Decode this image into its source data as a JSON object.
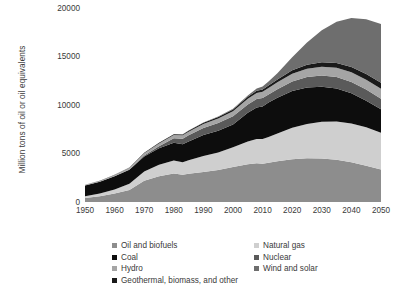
{
  "chart_data": {
    "type": "area",
    "stacked": true,
    "title": "",
    "subtitle": "",
    "xlabel": "",
    "ylabel": "Million tons of oil or oil equivalents",
    "xlim": [
      1950,
      2050
    ],
    "ylim": [
      0,
      20000
    ],
    "grid": false,
    "legend_position": "bottom",
    "x_ticks": [
      "1950",
      "1960",
      "1970",
      "1980",
      "1990",
      "2000",
      "2010",
      "2020",
      "2030",
      "2040",
      "2050"
    ],
    "y_ticks": [
      "0",
      "5000",
      "10000",
      "15000",
      "20000"
    ],
    "x": [
      1950,
      1955,
      1960,
      1965,
      1970,
      1975,
      1980,
      1983,
      1985,
      1990,
      1995,
      2000,
      2005,
      2008,
      2010,
      2012,
      2015,
      2020,
      2025,
      2030,
      2035,
      2040,
      2045,
      2050
    ],
    "series": [
      {
        "name": "Oil and biofuels",
        "color": "#8d8d8d",
        "values": [
          420,
          600,
          880,
          1250,
          2200,
          2650,
          2950,
          2800,
          2900,
          3100,
          3300,
          3600,
          3900,
          4000,
          3950,
          4050,
          4200,
          4400,
          4500,
          4480,
          4350,
          4100,
          3750,
          3350
        ]
      },
      {
        "name": "Natural gas",
        "color": "#cfcfcf",
        "values": [
          180,
          280,
          420,
          620,
          950,
          1180,
          1320,
          1300,
          1400,
          1650,
          1800,
          2050,
          2350,
          2500,
          2550,
          2650,
          2850,
          3250,
          3550,
          3800,
          3950,
          4000,
          3950,
          3800
        ]
      },
      {
        "name": "Coal",
        "color": "#0d0d0d",
        "values": [
          1100,
          1200,
          1350,
          1450,
          1550,
          1700,
          1850,
          1850,
          1950,
          2150,
          2250,
          2350,
          2950,
          3250,
          3350,
          3550,
          3700,
          3800,
          3750,
          3600,
          3400,
          3100,
          2750,
          2400
        ]
      },
      {
        "name": "Nuclear",
        "color": "#5a5a5a",
        "values": [
          0,
          0,
          10,
          30,
          90,
          230,
          450,
          560,
          620,
          720,
          790,
          840,
          860,
          880,
          870,
          830,
          870,
          980,
          1080,
          1150,
          1180,
          1180,
          1150,
          1100
        ]
      },
      {
        "name": "Hydro",
        "color": "#a5a5a5",
        "values": [
          70,
          95,
          130,
          175,
          230,
          280,
          330,
          360,
          380,
          430,
          480,
          520,
          580,
          620,
          650,
          680,
          720,
          800,
          870,
          920,
          960,
          990,
          1010,
          1030
        ]
      },
      {
        "name": "Geothermal, biomass, and other",
        "color": "#1a1a1a",
        "values": [
          20,
          25,
          32,
          42,
          55,
          70,
          85,
          95,
          105,
          125,
          145,
          170,
          200,
          220,
          235,
          250,
          280,
          340,
          400,
          450,
          500,
          540,
          575,
          610
        ]
      },
      {
        "name": "Wind and solar",
        "color": "#6e6e6e",
        "values": [
          0,
          0,
          0,
          0,
          0,
          2,
          5,
          8,
          12,
          25,
          45,
          80,
          150,
          230,
          300,
          420,
          650,
          1350,
          2300,
          3300,
          4250,
          5050,
          5650,
          6050
        ]
      }
    ],
    "legend_left": [
      {
        "label": "Oil and biofuels",
        "color": "#8d8d8d"
      },
      {
        "label": "Coal",
        "color": "#0d0d0d"
      },
      {
        "label": "Hydro",
        "color": "#a5a5a5"
      },
      {
        "label": "Geothermal, biomass, and other",
        "color": "#1a1a1a"
      }
    ],
    "legend_right": [
      {
        "label": "Natural gas",
        "color": "#cfcfcf"
      },
      {
        "label": "Nuclear",
        "color": "#5a5a5a"
      },
      {
        "label": "Wind and solar",
        "color": "#6e6e6e"
      }
    ]
  }
}
